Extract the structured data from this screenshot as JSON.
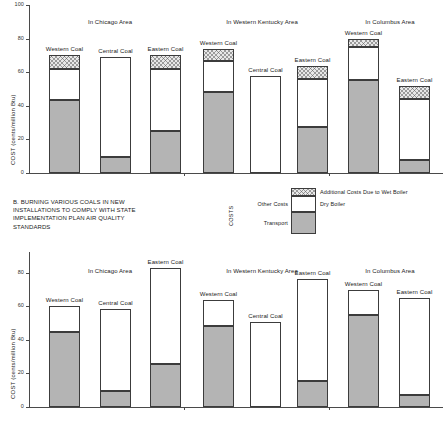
{
  "caption": "B. BURNING VARIOUS COALS IN NEW INSTALLATIONS TO COMPLY WITH STATE IMPLEMENTATION PLAN AIR QUALITY STANDARDS",
  "axis": {
    "y_title": "COST (cents/million Btu)",
    "ticks": [
      "0",
      "20",
      "40",
      "60",
      "80",
      "100"
    ],
    "min": 0,
    "max": 100
  },
  "legend": {
    "axis_label": "COSTS",
    "left_labels": [
      "Other Costs",
      "Transport"
    ],
    "right_labels": [
      "Additional Costs Due to Wet Boiler",
      "Dry Boiler"
    ],
    "series": [
      "Transport",
      "Other Costs",
      "Additional Costs Due to Wet Boiler"
    ],
    "colors": {
      "transport": "#b4b4b4",
      "other": "#ffffff",
      "wet": "#e8e8e8",
      "outline": "#3c3c3c"
    }
  },
  "chart_data": [
    {
      "id": "top",
      "type": "bar",
      "stacked": true,
      "title": "",
      "xlabel": "",
      "ylabel": "COST (cents/million Btu)",
      "ylim": [
        0,
        100
      ],
      "yticks": [
        0,
        20,
        40,
        60,
        80,
        100
      ],
      "grid": false,
      "groups": [
        "In Chicago Area",
        "In Western Kentucky Area",
        "In Columbus Area"
      ],
      "categories": [
        "Western Coal",
        "Central Coal",
        "Eastern Coal",
        "Western Coal",
        "Central Coal",
        "Eastern Coal",
        "Western Coal",
        "Eastern Coal"
      ],
      "series": [
        {
          "name": "Transport",
          "values": [
            43.5,
            9.5,
            25.0,
            48.0,
            0.0,
            27.5,
            55.5,
            7.5
          ]
        },
        {
          "name": "Other Costs",
          "values": [
            18.5,
            59.5,
            37.0,
            18.5,
            58.0,
            28.5,
            19.5,
            36.5
          ]
        },
        {
          "name": "Additional Costs Due to Wet Boiler",
          "values": [
            8.5,
            0.0,
            8.5,
            7.5,
            0.0,
            7.5,
            4.5,
            8.0
          ]
        }
      ],
      "totals": [
        70.5,
        69.0,
        70.5,
        74.0,
        58.0,
        63.5,
        79.5,
        52.0
      ]
    },
    {
      "id": "bottom",
      "type": "bar",
      "stacked": true,
      "title": "",
      "xlabel": "",
      "ylabel": "COST (cents/million Btu)",
      "ylim": [
        0,
        100
      ],
      "yticks": [
        0,
        20,
        40,
        60,
        80,
        100
      ],
      "grid": false,
      "groups": [
        "In Chicago Area",
        "In Western Kentucky Area",
        "In Columbus Area"
      ],
      "categories": [
        "Western Coal",
        "Central Coal",
        "Eastern Coal",
        "Western Coal",
        "Central Coal",
        "Eastern Coal",
        "Western Coal",
        "Eastern Coal"
      ],
      "series": [
        {
          "name": "Transport",
          "values": [
            44.5,
            9.5,
            25.5,
            48.5,
            0.0,
            15.5,
            55.0,
            7.0
          ]
        },
        {
          "name": "Other Costs",
          "values": [
            15.5,
            49.0,
            57.5,
            15.0,
            50.5,
            60.5,
            14.5,
            58.0
          ]
        },
        {
          "name": "Additional Costs Due to Wet Boiler",
          "values": [
            0.0,
            0.0,
            0.0,
            0.0,
            0.0,
            0.0,
            0.0,
            0.0
          ]
        }
      ],
      "totals": [
        60.0,
        58.5,
        83.0,
        63.5,
        50.5,
        76.0,
        69.5,
        65.0
      ]
    }
  ]
}
